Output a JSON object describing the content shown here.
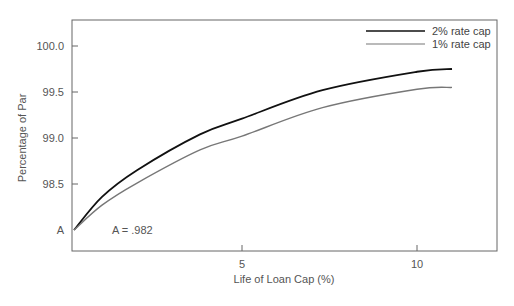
{
  "chart_data": {
    "type": "line",
    "title": "",
    "xlabel": "Life of Loan Cap (%)",
    "ylabel": "Percentage of Par",
    "xlim": [
      0,
      12.5
    ],
    "ylim": [
      97.8,
      100.3
    ],
    "x_ticks": [
      5,
      10
    ],
    "x_tick_labels": [
      "5",
      "10"
    ],
    "y_ticks": [
      98.0,
      98.5,
      99.0,
      99.5,
      100.0
    ],
    "y_tick_labels": [
      "A",
      "98.5",
      "99.0",
      "99.5",
      "100.0"
    ],
    "grid": false,
    "legend_position": "top-right",
    "annotation": "A = .982",
    "x": [
      0.2,
      1,
      2,
      3.8,
      5,
      7.3,
      10,
      11
    ],
    "series": [
      {
        "name": "2% rate cap",
        "color": "#111111",
        "values": [
          98.0,
          98.36,
          98.65,
          99.04,
          99.21,
          99.52,
          99.72,
          99.75
        ]
      },
      {
        "name": "1% rate cap",
        "color": "#777777",
        "values": [
          98.0,
          98.27,
          98.51,
          98.87,
          99.02,
          99.33,
          99.53,
          99.55
        ]
      }
    ]
  }
}
